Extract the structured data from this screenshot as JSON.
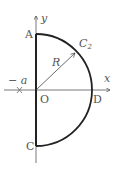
{
  "diagram": {
    "type": "geometry",
    "colors": {
      "curve": "#222222",
      "axis": "#444444",
      "label": "#555555",
      "background": "#ffffff"
    },
    "axes": {
      "x_label": "x",
      "y_label": "y"
    },
    "points": {
      "A": "A",
      "C": "C",
      "D": "D",
      "O": "O",
      "neg_a": "− a"
    },
    "curve_label": "C",
    "curve_subscript": "2",
    "radius_label": "R"
  }
}
